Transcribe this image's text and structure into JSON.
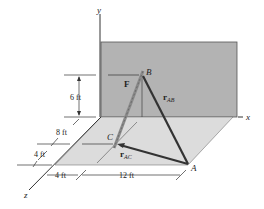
{
  "diagram": {
    "type": "3D statics force diagram",
    "axes": {
      "x": "x",
      "y": "y",
      "z": "z"
    },
    "points": {
      "A": "A",
      "B": "B",
      "C": "C"
    },
    "force_label": "F",
    "vectors": {
      "rAB": {
        "main": "r",
        "sub": "AB"
      },
      "rAC": {
        "main": "r",
        "sub": "AC"
      }
    },
    "dimensions": {
      "height_B": "6 ft",
      "z_8": "8 ft",
      "z_4": "4 ft",
      "x_4": "4 ft",
      "x_12": "12 ft"
    },
    "colors": {
      "wall": "#b3b3b3",
      "floor": "#dcdcdc",
      "line": "#333333",
      "force_rope": "#8a8a8a"
    }
  }
}
